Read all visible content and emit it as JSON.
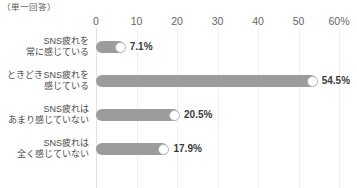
{
  "header": {
    "title": "あなたは、SNS疲れ（ソーシャル疲れ）を感じることがありますか。",
    "subtitle": "（単一回答）"
  },
  "chart_data": {
    "type": "bar",
    "orientation": "horizontal",
    "title": "あなたは、SNS疲れ（ソーシャル疲れ）を感じることがありますか。",
    "subtitle": "（単一回答）",
    "xlabel": "",
    "ylabel": "",
    "xlim": [
      0,
      60
    ],
    "grid": true,
    "legend": false,
    "tick_labels": [
      "0",
      "10",
      "20",
      "30",
      "40",
      "50",
      "60%"
    ],
    "ticks": [
      0,
      10,
      20,
      30,
      40,
      50,
      60
    ],
    "categories": [
      "SNS疲れを\n常に感じている",
      "ときどきSNS疲れを\n感じている",
      "SNS疲れは\nあまり感じていない",
      "SNS疲れは\n全く感じていない"
    ],
    "values": [
      7.1,
      54.5,
      20.5,
      17.9
    ],
    "value_labels": [
      "7.1%",
      "54.5%",
      "20.5%",
      "17.9%"
    ],
    "bar_color": "#9c9c9c",
    "cap_color": "#ffffff",
    "grid_color": "#f0f0f0"
  },
  "rows": [
    {
      "line1": "SNS疲れを",
      "line2": "常に感じている",
      "value": 7.1,
      "value_label": "7.1%"
    },
    {
      "line1": "ときどきSNS疲れを",
      "line2": "感じている",
      "value": 54.5,
      "value_label": "54.5%"
    },
    {
      "line1": "SNS疲れは",
      "line2": "あまり感じていない",
      "value": 20.5,
      "value_label": "20.5%"
    },
    {
      "line1": "SNS疲れは",
      "line2": "全く感じていない",
      "value": 17.9,
      "value_label": "17.9%"
    }
  ]
}
